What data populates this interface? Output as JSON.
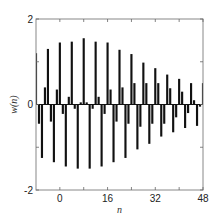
{
  "chart_data": {
    "type": "bar",
    "title": "",
    "xlabel": "n",
    "ylabel": "w(n)",
    "xlim": [
      -8,
      48
    ],
    "ylim": [
      -2,
      2
    ],
    "xticks": [
      0,
      8,
      16,
      24,
      32,
      40,
      48
    ],
    "xtick_labels": [
      "0",
      "16",
      "32",
      "48"
    ],
    "xtick_label_values": [
      0,
      16,
      32,
      48
    ],
    "yticks": [
      -2,
      -1,
      0,
      1,
      2
    ],
    "ytick_labels": [
      "2",
      "0",
      "-2"
    ],
    "ytick_label_values": [
      2,
      0,
      -2
    ],
    "grid": false,
    "legend": null,
    "bar_color": "#111111",
    "x": [
      -8,
      -7,
      -6,
      -5,
      -4,
      -3,
      -2,
      -1,
      0,
      1,
      2,
      3,
      4,
      5,
      6,
      7,
      8,
      9,
      10,
      11,
      12,
      13,
      14,
      15,
      16,
      17,
      18,
      19,
      20,
      21,
      22,
      23,
      24,
      25,
      26,
      27,
      28,
      29,
      30,
      31,
      32,
      33,
      34,
      35,
      36,
      37,
      38,
      39,
      40,
      41,
      42,
      43,
      44,
      45,
      46,
      47,
      48
    ],
    "values": [
      1.2,
      -0.45,
      -1.25,
      0.4,
      1.3,
      -0.4,
      -1.35,
      0.35,
      1.45,
      -0.22,
      -1.45,
      0.18,
      1.47,
      -0.1,
      -1.5,
      0.05,
      1.55,
      0.05,
      -1.5,
      -0.1,
      1.47,
      0.18,
      -1.45,
      -0.22,
      1.45,
      0.35,
      -1.35,
      -0.4,
      1.28,
      0.4,
      -1.25,
      -0.45,
      1.18,
      0.5,
      -1.05,
      -0.52,
      0.98,
      0.5,
      -0.92,
      -0.45,
      0.85,
      0.5,
      -0.75,
      -0.45,
      0.7,
      0.38,
      -0.65,
      -0.3,
      0.6,
      0.3,
      -0.55,
      -0.2,
      0.5,
      0.1,
      -0.5,
      -0.05,
      0.5
    ]
  }
}
